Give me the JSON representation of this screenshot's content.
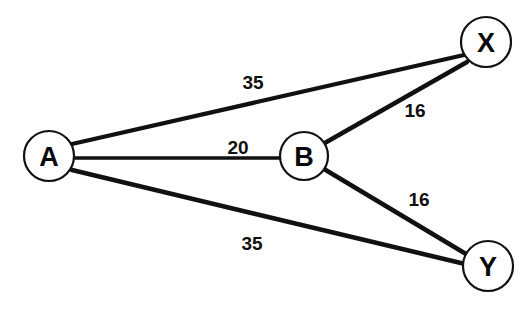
{
  "diagram": {
    "type": "node-link-graph",
    "background_color": "#ffffff",
    "stroke_color": "#111111",
    "nodes": [
      {
        "id": "A",
        "label": "A",
        "cx": 49,
        "cy": 156,
        "r": 25
      },
      {
        "id": "B",
        "label": "B",
        "cx": 304,
        "cy": 156,
        "r": 24
      },
      {
        "id": "X",
        "label": "X",
        "cx": 486,
        "cy": 42,
        "r": 25
      },
      {
        "id": "Y",
        "label": "Y",
        "cx": 488,
        "cy": 266,
        "r": 25
      }
    ],
    "edges": [
      {
        "id": "A-X",
        "from": "A",
        "to": "X",
        "weight": "35",
        "label_x": 253,
        "label_y": 82,
        "width": 4.2,
        "x1": 72,
        "y1": 144,
        "x2": 464,
        "y2": 55
      },
      {
        "id": "A-B",
        "from": "A",
        "to": "B",
        "weight": "20",
        "label_x": 238,
        "label_y": 147,
        "width": 3.4,
        "x1": 73,
        "y1": 158,
        "x2": 281,
        "y2": 158
      },
      {
        "id": "A-Y",
        "from": "A",
        "to": "Y",
        "weight": "35",
        "label_x": 252,
        "label_y": 243,
        "width": 4.6,
        "x1": 72,
        "y1": 170,
        "x2": 465,
        "y2": 264
      },
      {
        "id": "B-X",
        "from": "B",
        "to": "X",
        "weight": "16",
        "label_x": 415,
        "label_y": 110,
        "width": 4.6,
        "x1": 323,
        "y1": 144,
        "x2": 467,
        "y2": 62
      },
      {
        "id": "B-Y",
        "from": "B",
        "to": "Y",
        "weight": "16",
        "label_x": 419,
        "label_y": 199,
        "width": 4.6,
        "x1": 324,
        "y1": 169,
        "x2": 466,
        "y2": 254
      }
    ]
  }
}
